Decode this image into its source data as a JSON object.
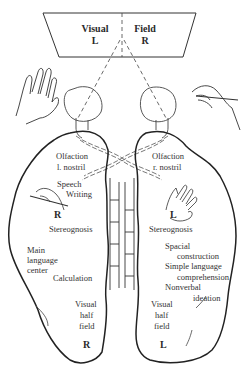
{
  "visual_field": {
    "title_left": "Visual",
    "title_right": "Field",
    "left_label": "L",
    "right_label": "R"
  },
  "left_hemisphere": {
    "labels": {
      "olfaction": "Olfaction",
      "nostril": "l. nostril",
      "speech": "Speech",
      "writing": "Writing",
      "hand_label": "R",
      "stereognosis": "Stereognosis",
      "main": "Main",
      "language": "language",
      "center": "center",
      "calculation": "Calculation",
      "visual": "Visual",
      "half": "half",
      "field": "field",
      "side": "R"
    }
  },
  "right_hemisphere": {
    "labels": {
      "olfaction": "Olfaction",
      "nostril": "r. nostril",
      "hand_label": "L",
      "stereognosis": "Stereognosis",
      "spacial": "Spacial",
      "construction": "construction",
      "simple_language": "Simple language",
      "comprehension": "comprehension",
      "nonverbal": "Nonverbal",
      "ideation": "ideation",
      "visual": "Visual",
      "half": "half",
      "field": "field",
      "side": "L"
    }
  },
  "icons": [
    "left-hand-open-icon",
    "right-hand-writing-icon",
    "left-eye-icon",
    "right-eye-icon",
    "corpus-callosum-icon",
    "optic-chiasm-icon"
  ]
}
